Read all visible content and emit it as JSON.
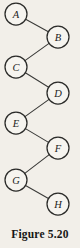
{
  "figure": {
    "caption": "Figure 5.20",
    "background_color": "#f2efe9",
    "node_fill_color": "#f6f4ef",
    "node_stroke_color": "#2b2b29",
    "edge_color": "#3a3a38"
  },
  "diagram": {
    "type": "tree",
    "width": 80,
    "height": 248,
    "node_radius": 11,
    "nodes": [
      {
        "id": "A",
        "label": "A",
        "cx": 16,
        "cy": 14
      },
      {
        "id": "B",
        "label": "B",
        "cx": 58,
        "cy": 37
      },
      {
        "id": "C",
        "label": "C",
        "cx": 16,
        "cy": 67
      },
      {
        "id": "D",
        "label": "D",
        "cx": 58,
        "cy": 93
      },
      {
        "id": "E",
        "label": "E",
        "cx": 16,
        "cy": 123
      },
      {
        "id": "F",
        "label": "F",
        "cx": 58,
        "cy": 148
      },
      {
        "id": "G",
        "label": "G",
        "cx": 16,
        "cy": 180
      },
      {
        "id": "H",
        "label": "H",
        "cx": 58,
        "cy": 204
      }
    ],
    "edges": [
      {
        "from": "A",
        "to": "B"
      },
      {
        "from": "B",
        "to": "C"
      },
      {
        "from": "C",
        "to": "D"
      },
      {
        "from": "D",
        "to": "E"
      },
      {
        "from": "E",
        "to": "F"
      },
      {
        "from": "F",
        "to": "G"
      },
      {
        "from": "G",
        "to": "H"
      }
    ]
  }
}
